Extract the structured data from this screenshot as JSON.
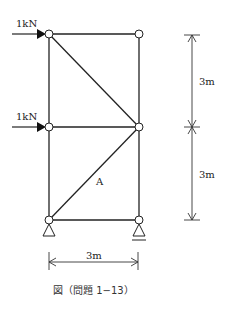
{
  "diagram": {
    "type": "truss",
    "loads": [
      {
        "label": "1kN",
        "node": "top-left",
        "direction": "right"
      },
      {
        "label": "1kN",
        "node": "mid-left",
        "direction": "right"
      }
    ],
    "member_label": "A",
    "dimensions": {
      "vertical_upper": "3m",
      "vertical_lower": "3m",
      "horizontal": "3m"
    },
    "supports": [
      {
        "node": "bottom-left",
        "type": "pin"
      },
      {
        "node": "bottom-right",
        "type": "roller"
      }
    ],
    "caption": "図（問題 1−13）",
    "colors": {
      "line": "#222222",
      "node_fill": "#ffffff"
    }
  }
}
